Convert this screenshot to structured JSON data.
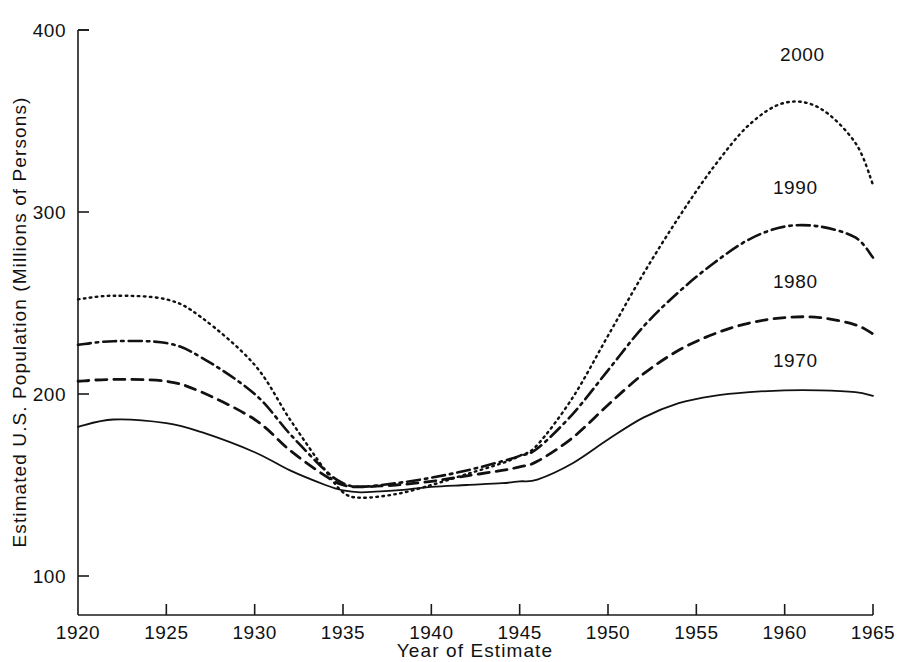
{
  "chart_data": {
    "type": "line",
    "title": "",
    "xlabel": "Year of Estimate",
    "ylabel": "Estimated U.S. Population (Millions of Persons)",
    "xlim": [
      1920,
      1965
    ],
    "ylim": [
      70,
      400
    ],
    "xticks": [
      1920,
      1925,
      1930,
      1935,
      1940,
      1945,
      1950,
      1955,
      1960,
      1965
    ],
    "xtick_labels": [
      "1920",
      "1925",
      "1930",
      "1935",
      "1940",
      "1945",
      "1950",
      "1955",
      "1960",
      "1965"
    ],
    "yticks": [
      100,
      200,
      300,
      400
    ],
    "ytick_labels": [
      "100",
      "200",
      "300",
      "400"
    ],
    "grid": false,
    "legend_position": "inline-right-of-curve",
    "x": [
      1920,
      1922,
      1925,
      1927,
      1930,
      1932,
      1934,
      1935,
      1936,
      1938,
      1940,
      1942,
      1944,
      1945,
      1946,
      1948,
      1950,
      1952,
      1954,
      1956,
      1958,
      1960,
      1962,
      1964,
      1965
    ],
    "series": [
      {
        "name": "1970",
        "label": "1970",
        "style": "solid",
        "color": "#111111",
        "values": [
          182,
          186,
          184,
          179,
          168,
          158,
          150,
          147,
          146,
          147,
          149,
          150,
          151,
          152,
          153,
          162,
          175,
          187,
          195,
          199,
          201,
          202,
          202,
          201,
          199
        ]
      },
      {
        "name": "1980",
        "label": "1980",
        "style": "dashed",
        "color": "#111111",
        "values": [
          207,
          208,
          207,
          201,
          186,
          169,
          155,
          150,
          149,
          150,
          152,
          155,
          158,
          160,
          163,
          176,
          194,
          211,
          224,
          233,
          239,
          242,
          242,
          238,
          233
        ]
      },
      {
        "name": "1990",
        "label": "1990",
        "style": "dashdot",
        "color": "#111111",
        "values": [
          227,
          229,
          228,
          220,
          200,
          178,
          158,
          151,
          149,
          151,
          154,
          158,
          163,
          166,
          170,
          189,
          213,
          237,
          256,
          272,
          285,
          292,
          292,
          286,
          275
        ]
      },
      {
        "name": "2000",
        "label": "2000",
        "style": "dotted",
        "color": "#111111",
        "values": [
          252,
          254,
          252,
          242,
          216,
          186,
          158,
          146,
          143,
          145,
          150,
          156,
          162,
          166,
          172,
          198,
          232,
          266,
          297,
          325,
          348,
          360,
          357,
          338,
          315
        ]
      }
    ],
    "series_label_positions": [
      {
        "name": "2000",
        "x": 1961.0,
        "y": 383
      },
      {
        "name": "1990",
        "x": 1960.6,
        "y": 310
      },
      {
        "name": "1980",
        "x": 1960.6,
        "y": 258
      },
      {
        "name": "1970",
        "x": 1960.6,
        "y": 215
      }
    ]
  },
  "axes": {
    "x_label": "Year of Estimate",
    "y_label": "Estimated U.S. Population (Millions of Persons)"
  }
}
